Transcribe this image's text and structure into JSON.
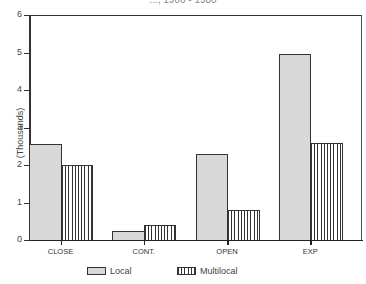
{
  "chart_data": {
    "type": "bar",
    "title": "..., 1966 - 1980",
    "xlabel": "",
    "ylabel": "(Thousands)",
    "ylim": [
      0,
      6
    ],
    "yticks": [
      "0",
      "1",
      "2",
      "3",
      "4",
      "5",
      "6"
    ],
    "categories": [
      "CLOSE",
      "CONT.",
      "OPEN",
      "EXP"
    ],
    "series": [
      {
        "name": "Local",
        "pattern": "stipple",
        "values": [
          2.55,
          0.25,
          2.3,
          4.95
        ]
      },
      {
        "name": "Multilocal",
        "pattern": "vertical-lines",
        "values": [
          2.0,
          0.4,
          0.8,
          2.6
        ]
      }
    ],
    "legend_position": "bottom",
    "grid": false
  },
  "legend": {
    "local": "Local",
    "multilocal": "Multilocal"
  }
}
